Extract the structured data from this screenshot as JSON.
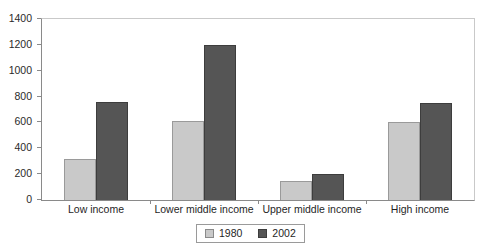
{
  "chart_data": {
    "type": "bar",
    "title": "",
    "subtitle": "",
    "xlabel": "",
    "ylabel": "",
    "categories": [
      "Low income",
      "Lower middle income",
      "Upper middle income",
      "High income"
    ],
    "series": [
      {
        "name": "1980",
        "color": "#c9c9c9",
        "values": [
          320,
          610,
          150,
          600
        ]
      },
      {
        "name": "2002",
        "color": "#555555",
        "values": [
          760,
          1200,
          200,
          750
        ]
      }
    ],
    "ylim": [
      0,
      1400
    ],
    "ytick_step": 200,
    "yticks": [
      0,
      200,
      400,
      600,
      800,
      1000,
      1200,
      1400
    ],
    "ytick_labels": [
      "0",
      "200",
      "400",
      "600",
      "800",
      "1000",
      "1200",
      "1400"
    ],
    "grid": false,
    "legend_position": "bottom-center",
    "legend_entries": [
      "1980",
      "2002"
    ],
    "annotations": []
  },
  "legend": {
    "items": [
      {
        "label": "1980",
        "swatch": "legend-swatch-1980"
      },
      {
        "label": "2002",
        "swatch": "legend-swatch-2002"
      }
    ]
  }
}
